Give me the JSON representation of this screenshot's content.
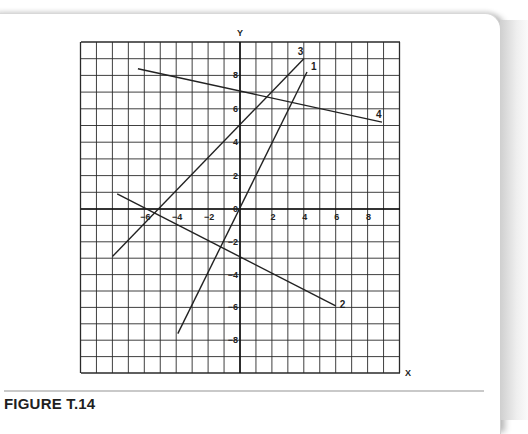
{
  "figure": {
    "caption": "FIGURE T.14",
    "x_axis_label": "X",
    "y_axis_label": "Y"
  },
  "colors": {
    "grid": "#2a2a2a",
    "lines": "#222222",
    "separator": "#c9c9c9"
  },
  "chart_data": {
    "type": "line",
    "title": "FIGURE T.14",
    "xlabel": "X",
    "ylabel": "Y",
    "xlim": [
      -10,
      10
    ],
    "ylim": [
      -10,
      10
    ],
    "grid": true,
    "x_ticks": [
      -6,
      -4,
      -2,
      2,
      4,
      6,
      8
    ],
    "y_ticks": [
      8,
      6,
      4,
      2,
      0,
      -2,
      -4,
      -6,
      -8
    ],
    "series": [
      {
        "name": "1",
        "label": "1",
        "points": [
          [
            -3.9,
            -7.6
          ],
          [
            4.2,
            8.2
          ]
        ]
      },
      {
        "name": "2",
        "label": "2",
        "points": [
          [
            -7.7,
            0.9
          ],
          [
            6.0,
            -5.9
          ]
        ]
      },
      {
        "name": "3",
        "label": "3",
        "points": [
          [
            -8.0,
            -2.9
          ],
          [
            4.0,
            9.0
          ]
        ]
      },
      {
        "name": "4",
        "label": "4",
        "points": [
          [
            -6.4,
            8.4
          ],
          [
            8.9,
            5.2
          ]
        ]
      }
    ]
  }
}
